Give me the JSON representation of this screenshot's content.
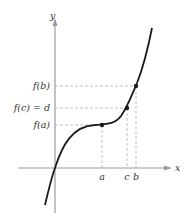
{
  "diagram": {
    "axes": {
      "x_label": "x",
      "y_label": "y"
    },
    "x_ticks": [
      {
        "label": "a",
        "x": 102
      },
      {
        "label": "c",
        "x": 127
      },
      {
        "label": "b",
        "x": 136
      }
    ],
    "y_ticks": [
      {
        "label": "f(b)",
        "y": 86
      },
      {
        "label": "f(c) = d",
        "y": 108
      },
      {
        "label": "f(a)",
        "y": 125
      }
    ],
    "points": [
      {
        "name": "a",
        "x": 102,
        "y": 125
      },
      {
        "name": "c",
        "x": 127,
        "y": 108
      },
      {
        "name": "b",
        "x": 136,
        "y": 86
      }
    ],
    "colors": {
      "curve": "#1a1a1a",
      "axis": "#9a9a9a",
      "dashed": "#b0b0b0",
      "text": "#333333"
    }
  }
}
